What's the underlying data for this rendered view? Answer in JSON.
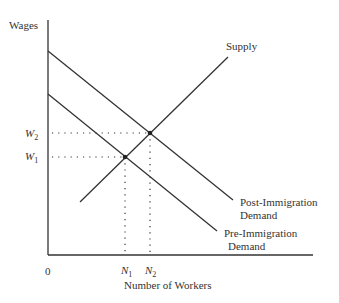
{
  "diagram": {
    "type": "supply-demand",
    "y_axis_label": "Wages",
    "x_axis_label": "Number of Workers",
    "origin_label": "0",
    "y_ticks": [
      {
        "label": "W",
        "sub": "2"
      },
      {
        "label": "W",
        "sub": "1"
      }
    ],
    "x_ticks": [
      {
        "label": "N",
        "sub": "1"
      },
      {
        "label": "N",
        "sub": "2"
      }
    ],
    "curves": {
      "supply": {
        "label": "Supply"
      },
      "post_demand": {
        "label_line1": "Post-Immigration",
        "label_line2": "Demand"
      },
      "pre_demand": {
        "label_line1": "Pre-Immigration",
        "label_line2": "Demand"
      }
    },
    "colors": {
      "line": "#333333",
      "background": "#ffffff"
    }
  }
}
